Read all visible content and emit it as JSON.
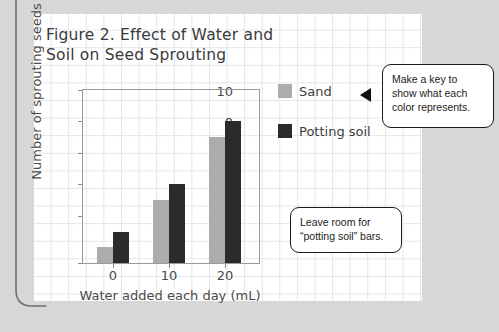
{
  "page": {
    "background_color": "#d7d7d7",
    "paper_color": "#ffffff",
    "grid_line_color": "#e3e6e8"
  },
  "chart_data": {
    "type": "bar",
    "title": "Figure 2. Effect of Water and\nSoil on Seed Sprouting",
    "xlabel": "Water added each day (mL)",
    "ylabel": "Number of sprouting seeds",
    "categories": [
      "0",
      "10",
      "20"
    ],
    "series": [
      {
        "name": "Sand",
        "color": "#acacac",
        "values": [
          1,
          4,
          8
        ]
      },
      {
        "name": "Potting soil",
        "color": "#2b2b2b",
        "values": [
          2,
          5,
          9
        ]
      }
    ],
    "ylim": [
      0,
      11
    ],
    "y_ticks": [
      "0",
      "2",
      "4",
      "6",
      "8",
      "10"
    ],
    "grid": false,
    "legend_position": "right"
  },
  "legend": {
    "items": [
      {
        "label": "Sand",
        "color": "#acacac"
      },
      {
        "label": "Potting soil",
        "color": "#2b2b2b"
      }
    ]
  },
  "callouts": {
    "key_note": "Make a key to\nshow what each\ncolor represents.",
    "room_note": "Leave room for\n“potting soil” bars."
  }
}
